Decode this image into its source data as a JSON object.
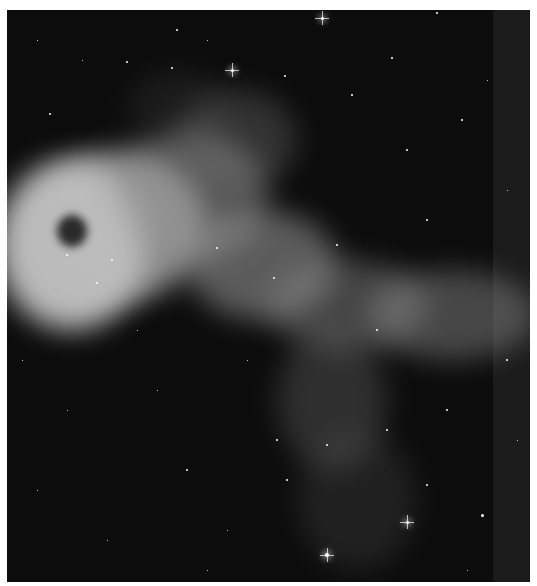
{
  "image": {
    "subject": "grayscale nebula astrophotograph",
    "background_color": "#0c0c0c",
    "page_color": "#ffffff"
  },
  "nebula_blobs": [
    {
      "x": -10,
      "y": 150,
      "w": 150,
      "h": 170,
      "o": 0.85,
      "c": "#d9d9d9"
    },
    {
      "x": 30,
      "y": 140,
      "w": 170,
      "h": 150,
      "o": 0.7,
      "c": "#bdbdbd"
    },
    {
      "x": 110,
      "y": 120,
      "w": 150,
      "h": 130,
      "o": 0.5,
      "c": "#9a9a9a"
    },
    {
      "x": 170,
      "y": 80,
      "w": 120,
      "h": 100,
      "o": 0.35,
      "c": "#7a7a7a"
    },
    {
      "x": 180,
      "y": 200,
      "w": 150,
      "h": 110,
      "o": 0.55,
      "c": "#9c9c9c"
    },
    {
      "x": 260,
      "y": 250,
      "w": 160,
      "h": 90,
      "o": 0.45,
      "c": "#8a8a8a"
    },
    {
      "x": 360,
      "y": 260,
      "w": 170,
      "h": 90,
      "o": 0.45,
      "c": "#8f8f8f"
    },
    {
      "x": 270,
      "y": 320,
      "w": 110,
      "h": 140,
      "o": 0.35,
      "c": "#707070"
    },
    {
      "x": 290,
      "y": 420,
      "w": 120,
      "h": 140,
      "o": 0.25,
      "c": "#5e5e5e"
    },
    {
      "x": 120,
      "y": 60,
      "w": 100,
      "h": 80,
      "o": 0.2,
      "c": "#5a5a5a"
    }
  ],
  "cavities": [
    {
      "x": 50,
      "y": 205,
      "w": 30,
      "h": 32
    }
  ],
  "stars": [
    {
      "x": 315,
      "y": 8,
      "r": 3,
      "big": true
    },
    {
      "x": 225,
      "y": 60,
      "r": 3,
      "big": true
    },
    {
      "x": 120,
      "y": 52,
      "r": 2
    },
    {
      "x": 165,
      "y": 58,
      "r": 2
    },
    {
      "x": 278,
      "y": 66,
      "r": 2
    },
    {
      "x": 43,
      "y": 104,
      "r": 2
    },
    {
      "x": 385,
      "y": 48,
      "r": 2
    },
    {
      "x": 430,
      "y": 3,
      "r": 2
    },
    {
      "x": 455,
      "y": 110,
      "r": 2
    },
    {
      "x": 170,
      "y": 20,
      "r": 2
    },
    {
      "x": 30,
      "y": 30,
      "r": 1
    },
    {
      "x": 75,
      "y": 50,
      "r": 1
    },
    {
      "x": 200,
      "y": 30,
      "r": 1
    },
    {
      "x": 345,
      "y": 85,
      "r": 2
    },
    {
      "x": 400,
      "y": 140,
      "r": 2
    },
    {
      "x": 480,
      "y": 70,
      "r": 1
    },
    {
      "x": 500,
      "y": 180,
      "r": 1
    },
    {
      "x": 420,
      "y": 210,
      "r": 2
    },
    {
      "x": 330,
      "y": 235,
      "r": 2
    },
    {
      "x": 105,
      "y": 250,
      "r": 2
    },
    {
      "x": 90,
      "y": 273,
      "r": 2
    },
    {
      "x": 60,
      "y": 245,
      "r": 2
    },
    {
      "x": 210,
      "y": 238,
      "r": 2
    },
    {
      "x": 267,
      "y": 268,
      "r": 2
    },
    {
      "x": 370,
      "y": 320,
      "r": 2
    },
    {
      "x": 320,
      "y": 545,
      "r": 4,
      "big": true
    },
    {
      "x": 400,
      "y": 512,
      "r": 3,
      "big": true
    },
    {
      "x": 475,
      "y": 505,
      "r": 3
    },
    {
      "x": 420,
      "y": 475,
      "r": 2
    },
    {
      "x": 380,
      "y": 420,
      "r": 2
    },
    {
      "x": 280,
      "y": 470,
      "r": 2
    },
    {
      "x": 270,
      "y": 430,
      "r": 2
    },
    {
      "x": 320,
      "y": 435,
      "r": 2
    },
    {
      "x": 440,
      "y": 400,
      "r": 2
    },
    {
      "x": 180,
      "y": 460,
      "r": 2
    },
    {
      "x": 60,
      "y": 400,
      "r": 1
    },
    {
      "x": 30,
      "y": 480,
      "r": 1
    },
    {
      "x": 100,
      "y": 530,
      "r": 1
    },
    {
      "x": 150,
      "y": 380,
      "r": 1
    },
    {
      "x": 220,
      "y": 520,
      "r": 1
    },
    {
      "x": 15,
      "y": 350,
      "r": 1
    },
    {
      "x": 500,
      "y": 350,
      "r": 2
    },
    {
      "x": 510,
      "y": 430,
      "r": 1
    },
    {
      "x": 240,
      "y": 350,
      "r": 1
    },
    {
      "x": 130,
      "y": 320,
      "r": 1
    },
    {
      "x": 200,
      "y": 560,
      "r": 1
    },
    {
      "x": 460,
      "y": 560,
      "r": 1
    }
  ]
}
